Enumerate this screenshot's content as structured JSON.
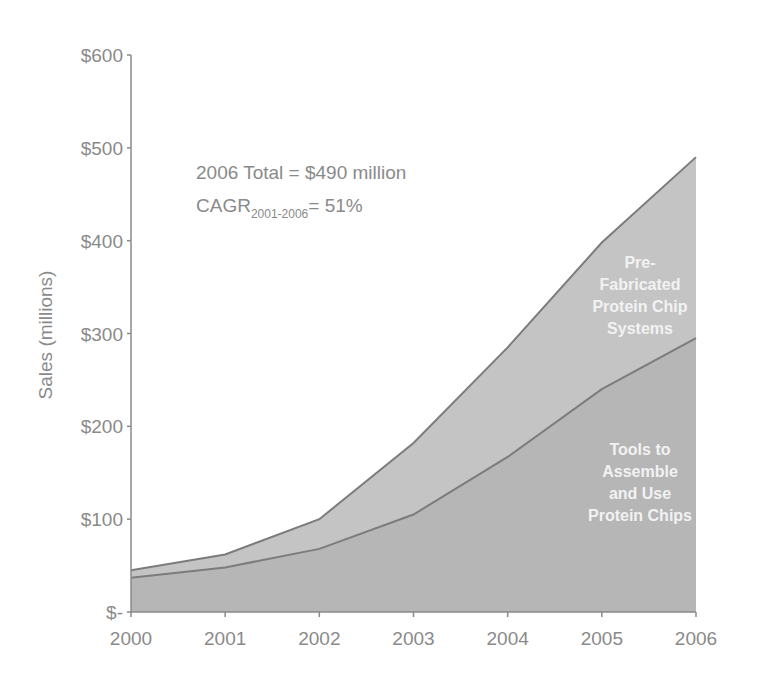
{
  "chart_data": {
    "type": "area",
    "stacked": true,
    "title": "",
    "xlabel": "",
    "ylabel": "Sales (millions)",
    "x": [
      2000,
      2001,
      2002,
      2003,
      2004,
      2005,
      2006
    ],
    "categories": [
      "2000",
      "2001",
      "2002",
      "2003",
      "2004",
      "2005",
      "2006"
    ],
    "ylim": [
      0,
      600
    ],
    "yticks": [
      "$-",
      "$100",
      "$200",
      "$300",
      "$400",
      "$500",
      "$600"
    ],
    "grid": false,
    "legend": "inline labels inside areas",
    "series": [
      {
        "name": "Tools to Assemble and Use Protein Chips",
        "values": [
          37,
          48,
          68,
          105,
          167,
          240,
          295
        ]
      },
      {
        "name": "Pre-Fabricated Protein Chip Systems",
        "values": [
          8,
          14,
          32,
          77,
          118,
          158,
          195
        ]
      }
    ],
    "totals": [
      45,
      62,
      100,
      182,
      285,
      398,
      490
    ],
    "annotations": [
      "2006 Total = $490 million",
      "CAGR 2001-2006 = 51%"
    ]
  },
  "axis": {
    "y_title": "Sales (millions)",
    "y_ticks": [
      "$600",
      "$500",
      "$400",
      "$300",
      "$200",
      "$100",
      "$-"
    ],
    "x_ticks": [
      "2000",
      "2001",
      "2002",
      "2003",
      "2004",
      "2005",
      "2006"
    ]
  },
  "annotation": {
    "line1": "2006 Total = $490 million",
    "cagr_main": "CAGR",
    "cagr_sub": "2001-2006",
    "cagr_value": "= 51%"
  },
  "labels": {
    "upper": [
      "Pre-",
      "Fabricated",
      "Protein Chip",
      "Systems"
    ],
    "lower": [
      "Tools to",
      "Assemble",
      "and Use",
      "Protein Chips"
    ]
  },
  "colors": {
    "upper_area": "#c2c2c2",
    "lower_area": "#b4b4b4",
    "line": "#7a7a7a",
    "axis": "#8a8a8a",
    "text": "#8a8a8a",
    "area_text": "#f2f2f2"
  }
}
